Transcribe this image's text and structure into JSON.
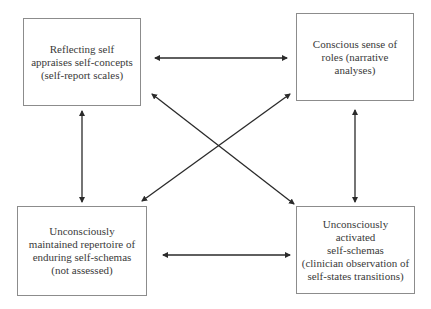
{
  "diagram": {
    "type": "four-node relationship diagram with bidirectional arrows",
    "line_color": "#2a2a2a",
    "border_color": "#8c8c8c",
    "text_color": "#3a3a3a",
    "nodes": [
      {
        "id": "tl",
        "position": "top-left",
        "lines": [
          "Reflecting self",
          "appraises self-concepts",
          "(self-report scales)"
        ],
        "text": "Reflecting self\nappraises self-concepts\n(self-report scales)"
      },
      {
        "id": "tr",
        "position": "top-right",
        "lines": [
          "Conscious sense of",
          "roles (narrative",
          "analyses)"
        ],
        "text": "Conscious sense of\nroles (narrative\nanalyses)"
      },
      {
        "id": "bl",
        "position": "bottom-left",
        "lines": [
          "Unconsciously",
          "maintained repertoire of",
          "enduring self-schemas",
          "(not assessed)"
        ],
        "text": "Unconsciously\nmaintained repertoire of\nenduring self-schemas\n(not assessed)"
      },
      {
        "id": "br",
        "position": "bottom-right",
        "lines": [
          "Unconsciously",
          "activated",
          "self-schemas",
          "(clinician observation of",
          "self-states transitions)"
        ],
        "text": "Unconsciously\nactivated\nself-schemas\n(clinician observation of\nself-states transitions)"
      }
    ],
    "edges": [
      {
        "from": "tl",
        "to": "tr",
        "direction": "bidirectional",
        "orientation": "horizontal"
      },
      {
        "from": "bl",
        "to": "br",
        "direction": "bidirectional",
        "orientation": "horizontal"
      },
      {
        "from": "tl",
        "to": "bl",
        "direction": "bidirectional",
        "orientation": "vertical"
      },
      {
        "from": "tr",
        "to": "br",
        "direction": "bidirectional",
        "orientation": "vertical"
      },
      {
        "from": "tl",
        "to": "br",
        "direction": "bidirectional",
        "orientation": "diagonal"
      },
      {
        "from": "tr",
        "to": "bl",
        "direction": "bidirectional",
        "orientation": "diagonal"
      }
    ]
  }
}
